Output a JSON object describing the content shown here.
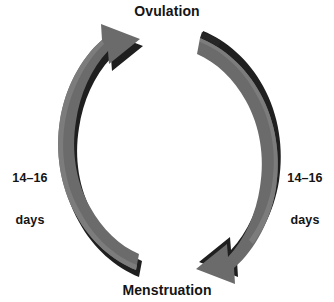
{
  "diagram": {
    "type": "cycle-diagram",
    "title_top": "Ovulation",
    "title_bottom": "Menstruation",
    "background_color": "#ffffff",
    "arc_fill_color": "#6b6b6b",
    "arc_shadow_color": "#1f1f1f",
    "text_color": "#141414",
    "labels": {
      "top": "Ovulation",
      "bottom": "Menstruation",
      "left_duration_value": "14–16",
      "left_duration_unit": "days",
      "right_duration_value": "14–16",
      "right_duration_unit": "days"
    },
    "arrows": [
      {
        "name": "left-arrow-up",
        "from": "Menstruation",
        "to": "Ovulation",
        "direction": "counterclockwise-upward",
        "duration": "14–16 days"
      },
      {
        "name": "right-arrow-down",
        "from": "Ovulation",
        "to": "Menstruation",
        "direction": "clockwise-downward",
        "duration": "14–16 days"
      }
    ]
  }
}
